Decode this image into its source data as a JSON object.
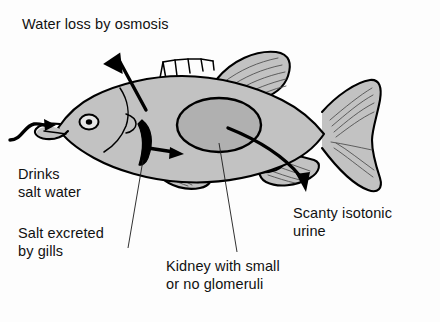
{
  "figure": {
    "background_color": "#fdfdfd",
    "ink_color": "#000000",
    "body_fill_color": "#c2c2c2",
    "kidney_fill_color": "#b0b0b0"
  },
  "labels": {
    "water_loss": "Water loss by osmosis",
    "drinks": "Drinks\nsalt water",
    "salt_gills": "Salt excreted\nby gills",
    "kidney": "Kidney with small\nor no glomeruli",
    "urine": "Scanty isotonic\nurine"
  },
  "annotations": [
    {
      "id": "water-loss",
      "text": "Water loss by osmosis",
      "marker": "bold-arrow",
      "direction": "up-left",
      "origin": "dorsal body surface",
      "meaning": "water leaves the body osmotically"
    },
    {
      "id": "drinks-salt-water",
      "text": "Drinks salt water",
      "marker": "wavy-arrow",
      "direction": "right-into-mouth",
      "origin": "surrounding seawater",
      "meaning": "fish swallows seawater to replace lost water"
    },
    {
      "id": "salt-excreted-by-gills",
      "text": "Salt excreted by gills",
      "marker": "bold-arrow",
      "direction": "right",
      "origin": "gill arch",
      "meaning": "chloride cells pump salt out at the gills"
    },
    {
      "id": "kidney",
      "text": "Kidney with small or no glomeruli",
      "marker": "leader-line",
      "origin": "kidney ellipse in mid body",
      "meaning": "reduced filtration conserves water"
    },
    {
      "id": "scanty-isotonic-urine",
      "text": "Scanty isotonic urine",
      "marker": "bold-arrow",
      "direction": "down-right",
      "origin": "vent near anal fin",
      "meaning": "small volume of urine isotonic to blood"
    }
  ],
  "anatomy": [
    {
      "part": "head",
      "detail": "with eye and open mouth"
    },
    {
      "part": "eye",
      "detail": "round with dark pupil"
    },
    {
      "part": "operculum",
      "detail": "gill cover arc behind head"
    },
    {
      "part": "gill-arch",
      "detail": "crescent shape inside opercular cavity"
    },
    {
      "part": "spiny-dorsal-fin",
      "detail": "comb of short spines on the back"
    },
    {
      "part": "soft-dorsal-fin",
      "detail": "triangular rayed fin behind spines"
    },
    {
      "part": "pectoral-fin",
      "detail": "rayed fin on the flank"
    },
    {
      "part": "pelvic-fin",
      "detail": "rayed fin on the ventral surface"
    },
    {
      "part": "anal-fin",
      "detail": "rayed fin near the vent"
    },
    {
      "part": "caudal-fin",
      "detail": "forked tail fin with rays"
    },
    {
      "part": "kidney",
      "detail": "large shaded ellipse in mid body"
    }
  ]
}
